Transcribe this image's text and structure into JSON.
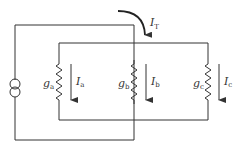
{
  "diagram": {
    "type": "circuit",
    "source": {
      "kind": "current-source"
    },
    "total_current": {
      "symbol": "I",
      "sub": "T"
    },
    "branches": [
      {
        "conductance": {
          "symbol": "g",
          "sub": "a"
        },
        "current": {
          "symbol": "I",
          "sub": "a"
        }
      },
      {
        "conductance": {
          "symbol": "g",
          "sub": "b"
        },
        "current": {
          "symbol": "I",
          "sub": "b"
        }
      },
      {
        "conductance": {
          "symbol": "g",
          "sub": "c"
        },
        "current": {
          "symbol": "I",
          "sub": "c"
        }
      }
    ],
    "colors": {
      "line": "#333333",
      "background": "#ffffff"
    }
  }
}
